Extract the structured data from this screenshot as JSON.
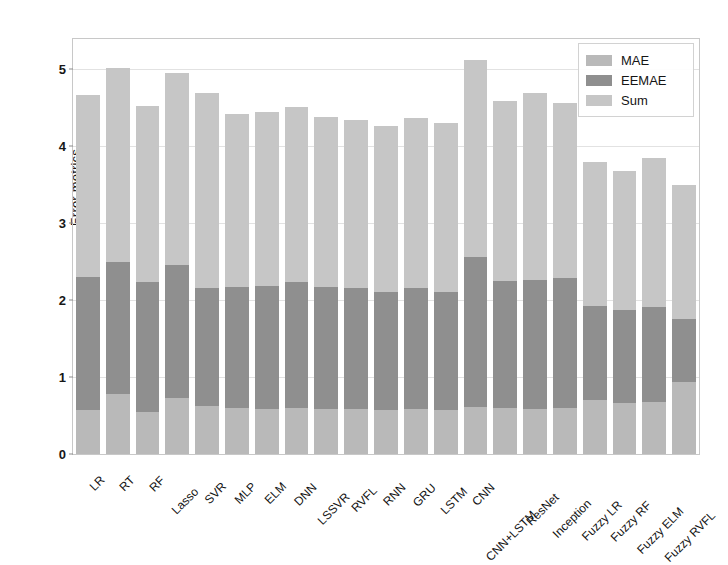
{
  "chart_data": {
    "type": "bar",
    "subtype": "stacked-bar",
    "title": "",
    "xlabel": "",
    "ylabel": "Error metrics",
    "ylim": [
      0,
      5.39
    ],
    "yticks": [
      0,
      1,
      2,
      3,
      4,
      5
    ],
    "ytick_labels": [
      "0",
      "1",
      "2",
      "3",
      "4",
      "5"
    ],
    "grid": true,
    "grid_axis": "y",
    "legend_position": "upper right",
    "categories": [
      "LR",
      "RT",
      "RF",
      "Lasso",
      "SVR",
      "MLP",
      "ELM",
      "DNN",
      "LSSVR",
      "RVFL",
      "RNN",
      "GRU",
      "LSTM",
      "CNN",
      "CNN+LSTM",
      "ResNet",
      "Inception",
      "Fuzzy LR",
      "Fuzzy RF",
      "Fuzzy ELM",
      "Fuzzy RVFL"
    ],
    "series": [
      {
        "name": "MAE",
        "color": "#b9b9b9",
        "values": [
          0.57,
          0.78,
          0.55,
          0.73,
          0.62,
          0.6,
          0.59,
          0.6,
          0.59,
          0.58,
          0.57,
          0.58,
          0.57,
          0.61,
          0.6,
          0.59,
          0.6,
          0.7,
          0.66,
          0.68,
          0.93
        ]
      },
      {
        "name": "EEMAE",
        "color": "#8f8f8f",
        "values": [
          1.73,
          1.71,
          1.68,
          1.72,
          1.54,
          1.57,
          1.59,
          1.63,
          1.58,
          1.58,
          1.54,
          1.57,
          1.53,
          1.95,
          1.65,
          1.67,
          1.68,
          1.22,
          1.21,
          1.23,
          0.82
        ]
      },
      {
        "name": "Sum",
        "color": "#c6c6c6",
        "values": [
          2.36,
          2.53,
          2.29,
          2.5,
          2.53,
          2.24,
          2.26,
          2.28,
          2.21,
          2.18,
          2.15,
          2.22,
          2.2,
          2.56,
          2.33,
          2.43,
          2.28,
          1.87,
          1.81,
          1.93,
          1.75
        ]
      }
    ],
    "totals": [
      4.66,
      5.02,
      4.52,
      4.95,
      4.69,
      4.41,
      4.44,
      4.51,
      4.38,
      4.34,
      4.26,
      4.37,
      4.3,
      5.12,
      4.58,
      4.69,
      4.56,
      3.79,
      3.68,
      3.84,
      3.5
    ]
  },
  "legend": {
    "entries": [
      {
        "label": "MAE",
        "color": "#b9b9b9"
      },
      {
        "label": "EEMAE",
        "color": "#8f8f8f"
      },
      {
        "label": "Sum",
        "color": "#c6c6c6"
      }
    ]
  },
  "axes": {
    "y_title": "Error metrics"
  }
}
